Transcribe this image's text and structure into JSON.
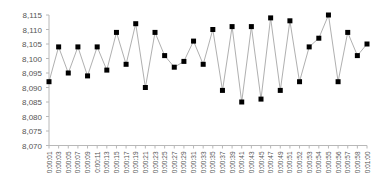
{
  "chart_data": {
    "type": "line",
    "title": "",
    "xlabel": "",
    "ylabel": "",
    "ylim": [
      8.07,
      8.115
    ],
    "yticks": [
      "8,070",
      "8,075",
      "8,080",
      "8,085",
      "8,090",
      "8,095",
      "8,100",
      "8,105",
      "8,110",
      "8,115"
    ],
    "ytick_values": [
      8.07,
      8.075,
      8.08,
      8.085,
      8.09,
      8.095,
      8.1,
      8.105,
      8.11,
      8.115
    ],
    "grid": false,
    "legend": null,
    "categories": [
      "0:00:01",
      "0:00:03",
      "0:00:05",
      "0:00:07",
      "0:00:09",
      "0:00:11",
      "0:00:13",
      "0:00:15",
      "0:00:17",
      "0:00:19",
      "0:00:21",
      "0:00:23",
      "0:00:25",
      "0:00:27",
      "0:00:29",
      "0:00:31",
      "0:00:33",
      "0:00:35",
      "0:00:37",
      "0:00:39",
      "0:00:41",
      "0:00:43",
      "0:00:45",
      "0:00:47",
      "0:00:49",
      "0:00:51",
      "0:00:52",
      "0:00:53",
      "0:00:54",
      "0:00:55",
      "0:00:56",
      "0:00:57",
      "0:00:58",
      "0:01:00"
    ],
    "series": [
      {
        "name": "series-1",
        "values": [
          8.092,
          8.104,
          8.095,
          8.104,
          8.094,
          8.104,
          8.096,
          8.109,
          8.098,
          8.112,
          8.09,
          8.109,
          8.101,
          8.097,
          8.099,
          8.106,
          8.098,
          8.11,
          8.089,
          8.111,
          8.085,
          8.111,
          8.086,
          8.114,
          8.089,
          8.113,
          8.092,
          8.104,
          8.107,
          8.115,
          8.092,
          8.109,
          8.101,
          8.105
        ]
      }
    ]
  },
  "colors": {
    "line": "#b0b0b0",
    "marker": "#000000",
    "axis": "#b8b8b8",
    "text": "#555555"
  }
}
